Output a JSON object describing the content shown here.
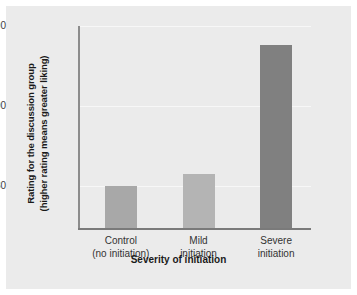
{
  "chart_data": {
    "type": "bar",
    "title": "",
    "xlabel": "Severity of initiation",
    "ylabel_line1": "Rating for the discussion group",
    "ylabel_line2": "(higher rating means greater liking)",
    "categories": [
      "Control\n(no initiation)",
      "Mild\ninitiation",
      "Severe\ninitiation"
    ],
    "category_lines": [
      [
        "Control",
        "(no initiation)"
      ],
      [
        "Mild",
        "initiation"
      ],
      [
        "Severe",
        "initiation"
      ]
    ],
    "values": [
      80.0,
      81.5,
      97.6
    ],
    "bar_colors": [
      "#a8a8a8",
      "#b4b4b4",
      "#808080"
    ],
    "ylim": [
      74.8,
      100
    ],
    "yticks": [
      100,
      90,
      80
    ],
    "ytick_labels": [
      "100",
      "90",
      "80"
    ],
    "grid": true,
    "grid_color": "#f7f7f7",
    "legend": "none",
    "plot_background": "#ebebeb",
    "axis_color": "#8c8c8c"
  },
  "axes": {
    "ytick_0": "100",
    "ytick_1": "90",
    "ytick_2": "80",
    "x_title": "Severity of initiation",
    "y_title_line1": "Rating for the discussion group",
    "y_title_line2": "(higher rating means greater liking)"
  },
  "bars": [
    {
      "label_line1": "Control",
      "label_line2": "(no initiation)",
      "value": 80.0,
      "color": "#a8a8a8"
    },
    {
      "label_line1": "Mild",
      "label_line2": "initiation",
      "value": 81.5,
      "color": "#b4b4b4"
    },
    {
      "label_line1": "Severe",
      "label_line2": "initiation",
      "value": 97.6,
      "color": "#808080"
    }
  ]
}
